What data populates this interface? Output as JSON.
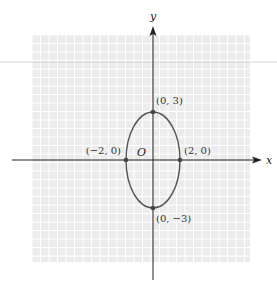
{
  "chart_data": {
    "type": "line",
    "title": "",
    "curve": "ellipse",
    "equation_shape": {
      "center": [
        0,
        0
      ],
      "semi_axis_x": 2,
      "semi_axis_y": 3
    },
    "xlabel": "x",
    "ylabel": "y",
    "origin_label": "O",
    "grid": true,
    "legend": null,
    "points": [
      {
        "x": 0,
        "y": 3,
        "label": "(0, 3)"
      },
      {
        "x": 2,
        "y": 0,
        "label": "(2, 0)"
      },
      {
        "x": -2,
        "y": 0,
        "label": "(−2, 0)"
      },
      {
        "x": 0,
        "y": -3,
        "label": "(0, −3)"
      }
    ],
    "colors": {
      "grid_background": "#ececec",
      "grid_lines": "#ffffff",
      "axes": "#222222",
      "curve": "#555555",
      "points": "#444444"
    }
  },
  "layout": {
    "origin_px": [
      153,
      160
    ],
    "unit_px_x": 13.5,
    "unit_px_y": 16,
    "grid_box": {
      "x": 32,
      "y": 35,
      "w": 218,
      "h": 227
    },
    "grid_step_px": 8.5
  }
}
